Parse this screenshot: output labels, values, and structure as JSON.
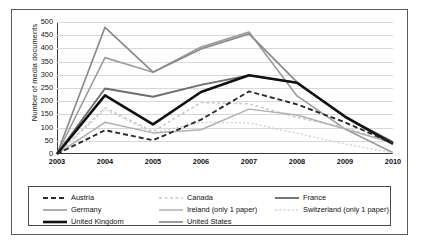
{
  "chart_data": {
    "type": "line",
    "title": "",
    "xlabel": "",
    "ylabel": "Number of media documents",
    "categories": [
      "2003",
      "2004",
      "2005",
      "2006",
      "2007",
      "2008",
      "2009",
      "2010"
    ],
    "x": [
      2003,
      2004,
      2005,
      2006,
      2007,
      2008,
      2009,
      2010
    ],
    "ylim": [
      0,
      500
    ],
    "xlim": [
      2003,
      2010
    ],
    "yticks": [
      0,
      50,
      100,
      150,
      200,
      250,
      300,
      350,
      400,
      450,
      500
    ],
    "xticks": [
      "2003",
      "2004",
      "2005",
      "2006",
      "2007",
      "2008",
      "2009",
      "2010"
    ],
    "grid": true,
    "legend_position": "bottom",
    "series": [
      {
        "name": "Austria",
        "style": "dashed",
        "color": "#2b2b2b",
        "width": 1.9,
        "dash": "5,3",
        "values": [
          0,
          90,
          52,
          130,
          237,
          188,
          120,
          40
        ]
      },
      {
        "name": "Canada",
        "style": "dotted",
        "color": "#c9c9c9",
        "width": 1.5,
        "dash": "3,2.5",
        "values": [
          0,
          175,
          85,
          195,
          190,
          138,
          100,
          42
        ]
      },
      {
        "name": "France",
        "style": "solid",
        "color": "#6e6e6e",
        "width": 1.9,
        "dash": "",
        "values": [
          0,
          248,
          217,
          262,
          298,
          270,
          140,
          45
        ]
      },
      {
        "name": "Germany",
        "style": "solid",
        "color": "#9c9c9c",
        "width": 1.6,
        "dash": "",
        "values": [
          0,
          365,
          310,
          405,
          462,
          220,
          95,
          5
        ]
      },
      {
        "name": "Ireland (only 1 paper)",
        "style": "solid",
        "color": "#b0b0b0",
        "width": 1.5,
        "dash": "",
        "values": [
          0,
          120,
          80,
          92,
          170,
          148,
          95,
          42
        ]
      },
      {
        "name": "Switzerland (only 1 paper)",
        "style": "dotted",
        "color": "#d2d2d2",
        "width": 1.4,
        "dash": "2,2.2",
        "values": [
          0,
          168,
          80,
          120,
          118,
          78,
          38,
          5
        ]
      },
      {
        "name": "United Kingdom",
        "style": "solid",
        "color": "#111111",
        "width": 2.6,
        "dash": "",
        "values": [
          0,
          222,
          112,
          235,
          298,
          270,
          142,
          38
        ]
      },
      {
        "name": "United States",
        "style": "solid",
        "color": "#8a8a8a",
        "width": 1.7,
        "dash": "",
        "values": [
          0,
          480,
          310,
          398,
          455,
          272,
          140,
          45
        ]
      }
    ]
  },
  "axis": {
    "ylabel": "Number of media documents",
    "yticks": [
      "500",
      "450",
      "400",
      "350",
      "300",
      "250",
      "200",
      "150",
      "100",
      "50",
      "0"
    ],
    "xticks": [
      "2003",
      "2004",
      "2005",
      "2006",
      "2007",
      "2008",
      "2009",
      "2010"
    ]
  },
  "legend": {
    "entries": [
      {
        "label": "Austria"
      },
      {
        "label": "Canada"
      },
      {
        "label": "France"
      },
      {
        "label": "Germany"
      },
      {
        "label": "Ireland (only 1 paper)"
      },
      {
        "label": "Switzerland (only 1 paper)"
      },
      {
        "label": "United Kingdom"
      },
      {
        "label": "United States"
      }
    ]
  },
  "colors": {
    "frame": "#5a5a5a",
    "grid": "#d8d8d8",
    "axis": "#3a3a3a",
    "background": "#ffffff"
  }
}
